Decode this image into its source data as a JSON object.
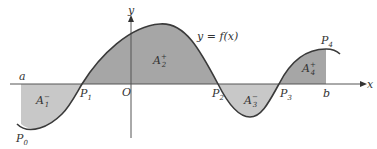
{
  "figure": {
    "function_label": "y = f(x)",
    "x_axis_label": "x",
    "y_axis_label": "y",
    "origin_label": "O",
    "left_bound_label": "a",
    "right_bound_label": "b",
    "points": [
      {
        "base": "P",
        "sub": "0"
      },
      {
        "base": "P",
        "sub": "1"
      },
      {
        "base": "P",
        "sub": "2"
      },
      {
        "base": "P",
        "sub": "3"
      },
      {
        "base": "P",
        "sub": "4"
      }
    ],
    "areas": [
      {
        "base": "A",
        "sub": "1",
        "sign": "−"
      },
      {
        "base": "A",
        "sub": "2",
        "sign": "+"
      },
      {
        "base": "A",
        "sub": "3",
        "sign": "−"
      },
      {
        "base": "A",
        "sub": "4",
        "sign": "+"
      }
    ],
    "colors": {
      "positive_fill": "#a6a6a6",
      "negative_fill": "#c8c8c8",
      "curve": "#3a3a3a",
      "axis": "#555555"
    }
  }
}
